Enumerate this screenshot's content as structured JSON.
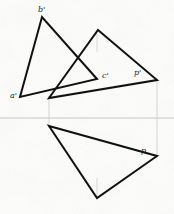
{
  "figure": {
    "width": 174,
    "height": 214,
    "background_color": "#fdfdfc",
    "line_color": "#111111",
    "axis_color": "#b9b9b9",
    "construction_color": "#c9c9c9"
  },
  "axis": {
    "name": "ground-line",
    "orientation": "horizontal",
    "y": 118,
    "x_start": 0,
    "x_end": 174,
    "stroke_width": 0.8
  },
  "construction_lines": [
    {
      "name": "projector-left",
      "x1": 49,
      "y1": 96,
      "x2": 49,
      "y2": 128,
      "stroke_width": 0.8
    },
    {
      "name": "projector-right",
      "x1": 157,
      "y1": 78,
      "x2": 157,
      "y2": 158,
      "stroke_width": 0.8
    },
    {
      "name": "altitude-upper",
      "x1": 97,
      "y1": 33,
      "x2": 97,
      "y2": 52,
      "stroke_width": 0.7
    },
    {
      "name": "altitude-lower",
      "x1": 97,
      "y1": 178,
      "x2": 97,
      "y2": 197,
      "stroke_width": 0.7
    }
  ],
  "shapes": [
    {
      "name": "triangle-abc-prime",
      "type": "polygon",
      "closed": true,
      "stroke_width": 2.0,
      "points": [
        {
          "label": "a'",
          "x": 20,
          "y": 97
        },
        {
          "label": "b'",
          "x": 42,
          "y": 17
        },
        {
          "label": "c'",
          "x": 97,
          "y": 79
        }
      ]
    },
    {
      "name": "triangle-upper-projection",
      "type": "polygon",
      "closed": true,
      "stroke_width": 2.0,
      "points": [
        {
          "label": "",
          "x": 98,
          "y": 30
        },
        {
          "label": "p'",
          "x": 157,
          "y": 80
        },
        {
          "label": "",
          "x": 49,
          "y": 98
        }
      ]
    },
    {
      "name": "triangle-lower-projection",
      "type": "polygon",
      "closed": true,
      "stroke_width": 2.0,
      "points": [
        {
          "label": "",
          "x": 49,
          "y": 126
        },
        {
          "label": "p",
          "x": 157,
          "y": 156
        },
        {
          "label": "",
          "x": 97,
          "y": 198
        }
      ]
    }
  ],
  "labels": [
    {
      "name": "label-b-prime",
      "text": "b'",
      "x": 38,
      "y": 6
    },
    {
      "name": "label-a-prime",
      "text": "a'",
      "x": 10,
      "y": 92
    },
    {
      "name": "label-c-prime",
      "text": "c'",
      "x": 102,
      "y": 72
    },
    {
      "name": "label-p-prime",
      "text": "p'",
      "x": 134,
      "y": 69
    },
    {
      "name": "label-p",
      "text": "p",
      "x": 141,
      "y": 147
    }
  ]
}
